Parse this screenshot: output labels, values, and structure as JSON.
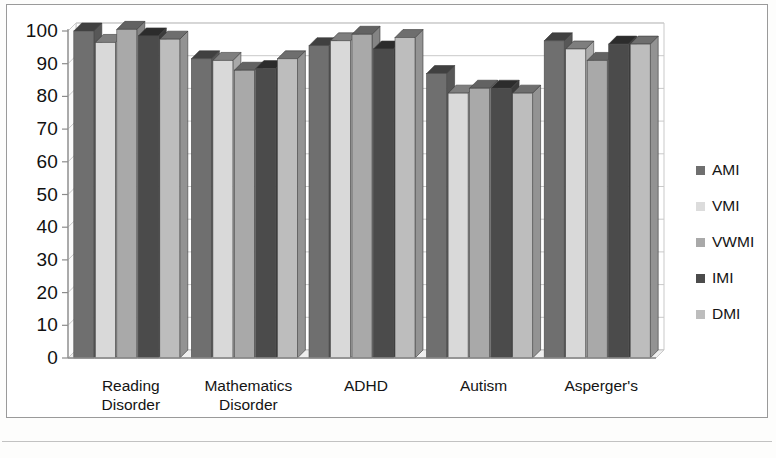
{
  "chart_data": {
    "type": "bar",
    "title": "",
    "subtitle": "",
    "xlabel": "",
    "ylabel": "",
    "ylim": [
      0,
      100
    ],
    "ytick_step": 10,
    "yticks": [
      100,
      90,
      80,
      70,
      60,
      50,
      40,
      30,
      20,
      10,
      0
    ],
    "grid": true,
    "grid_axis": "y",
    "legend_position": "right",
    "three_d": true,
    "categories": [
      "Reading Disorder",
      "Mathematics Disorder",
      "ADHD",
      "Autism",
      "Asperger's"
    ],
    "category_lines": [
      [
        "Reading",
        "Disorder"
      ],
      [
        "Mathematics",
        "Disorder"
      ],
      [
        "ADHD",
        ""
      ],
      [
        "Autism",
        ""
      ],
      [
        "Asperger's",
        ""
      ]
    ],
    "series": [
      {
        "name": "AMI",
        "color": "#6f6f6f",
        "values": [
          100,
          91.5,
          95.5,
          87,
          97
        ]
      },
      {
        "name": "VMI",
        "color": "#d9d9d9",
        "values": [
          96.5,
          91,
          97,
          81,
          94.5
        ]
      },
      {
        "name": "VWMI",
        "color": "#a9a9a9",
        "values": [
          100.5,
          88,
          99,
          82.5,
          91
        ]
      },
      {
        "name": "IMI",
        "color": "#4b4b4b",
        "values": [
          98.5,
          88.5,
          94.5,
          82.5,
          96
        ]
      },
      {
        "name": "DMI",
        "color": "#bdbdbd",
        "values": [
          97.5,
          91.5,
          98,
          81,
          96
        ]
      }
    ]
  },
  "legend": {
    "items": [
      {
        "label": "AMI",
        "color": "#6f6f6f"
      },
      {
        "label": "VMI",
        "color": "#dcdcdc"
      },
      {
        "label": "VWMI",
        "color": "#a9a9a9"
      },
      {
        "label": "IMI",
        "color": "#4b4b4b"
      },
      {
        "label": "DMI",
        "color": "#bdbdbd"
      }
    ]
  },
  "colors": {
    "axis": "#8c8c8c",
    "grid": "#c9c9c9",
    "text": "#141414",
    "frame": "#9a9a9a",
    "wall": "#ffffff",
    "floor": "#efefef"
  }
}
